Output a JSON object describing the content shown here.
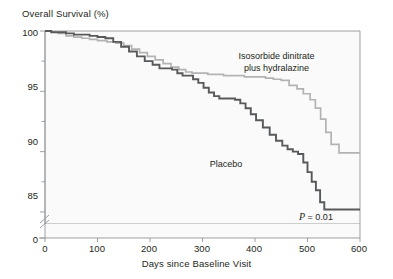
{
  "figure": {
    "kind": "kaplan-meier-survival-plot"
  },
  "chart_data": {
    "type": "line",
    "title": "",
    "ylabel": "Overall Survival (%)",
    "xlabel": "Days since Baseline Visit",
    "xlim": [
      0,
      600
    ],
    "ylim": [
      84,
      100
    ],
    "xticks": [
      0,
      100,
      200,
      300,
      400,
      500,
      600
    ],
    "xtick_labels": [
      "0",
      "100",
      "200",
      "300",
      "400",
      "500",
      "600"
    ],
    "yticks": [
      85,
      90,
      95,
      100
    ],
    "ytick_labels": [
      "85",
      "90",
      "95",
      "100"
    ],
    "y_minor_ticks": [
      87.5,
      92.5,
      97.5
    ],
    "y_axis_break": true,
    "y_axis_break_label": "0",
    "grid": false,
    "legend_position": "inline-annotations",
    "annotations": [
      {
        "name": "treatment-label",
        "text_line1": "Isosorbide dinitrate",
        "text_line2": "plus hydralazine",
        "x": 390,
        "y": 97.2
      },
      {
        "name": "placebo-label",
        "text": "Placebo",
        "x": 330,
        "y": 90.4
      },
      {
        "name": "p-value",
        "text": "P = 0.01",
        "x": 560,
        "y": 84.6
      }
    ],
    "series": [
      {
        "name": "Isosorbide dinitrate plus hydralazine",
        "color": "#b3b3b3",
        "step": "post",
        "x": [
          0,
          12,
          25,
          40,
          55,
          70,
          85,
          100,
          118,
          135,
          150,
          165,
          180,
          195,
          210,
          225,
          240,
          255,
          268,
          280,
          295,
          310,
          325,
          340,
          360,
          380,
          400,
          420,
          435,
          450,
          465,
          480,
          492,
          505,
          515,
          525,
          535,
          545,
          560,
          575,
          600
        ],
        "y": [
          100,
          99.9,
          99.8,
          99.6,
          99.5,
          99.4,
          99.3,
          99.2,
          99.1,
          99.0,
          98.8,
          98.5,
          98.2,
          97.9,
          97.6,
          97.3,
          97.0,
          96.8,
          96.6,
          96.5,
          96.5,
          96.4,
          96.4,
          96.3,
          96.3,
          96.2,
          96.2,
          96.1,
          96.0,
          95.9,
          95.5,
          95.2,
          94.8,
          94.3,
          93.6,
          92.7,
          91.6,
          90.6,
          89.9,
          89.9,
          89.9
        ]
      },
      {
        "name": "Placebo",
        "color": "#58595b",
        "step": "post",
        "x": [
          0,
          12,
          25,
          40,
          55,
          70,
          85,
          100,
          115,
          130,
          145,
          160,
          175,
          190,
          205,
          218,
          230,
          242,
          252,
          262,
          272,
          282,
          292,
          302,
          312,
          322,
          332,
          342,
          352,
          362,
          372,
          382,
          392,
          402,
          415,
          428,
          440,
          452,
          462,
          472,
          482,
          492,
          500,
          508,
          516,
          524,
          532,
          545,
          560,
          580,
          600
        ],
        "y": [
          100,
          99.9,
          99.9,
          99.8,
          99.7,
          99.7,
          99.6,
          99.5,
          99.4,
          99.1,
          98.7,
          98.3,
          97.9,
          97.5,
          97.2,
          96.9,
          96.9,
          96.8,
          96.5,
          96.3,
          96.3,
          96.0,
          95.7,
          95.3,
          94.9,
          94.6,
          94.4,
          94.4,
          94.4,
          94.3,
          94.0,
          93.6,
          93.1,
          92.6,
          92.0,
          91.4,
          90.9,
          90.5,
          90.2,
          90.0,
          89.8,
          89.1,
          88.3,
          87.5,
          86.8,
          85.8,
          85.2,
          85.2,
          85.2,
          85.2,
          85.2
        ]
      }
    ]
  },
  "colors": {
    "treatment_line": "#b3b3b3",
    "placebo_line": "#58595b",
    "axis": "#939598",
    "frame": "#939598",
    "text": "#231f20",
    "background": "#ffffff"
  }
}
